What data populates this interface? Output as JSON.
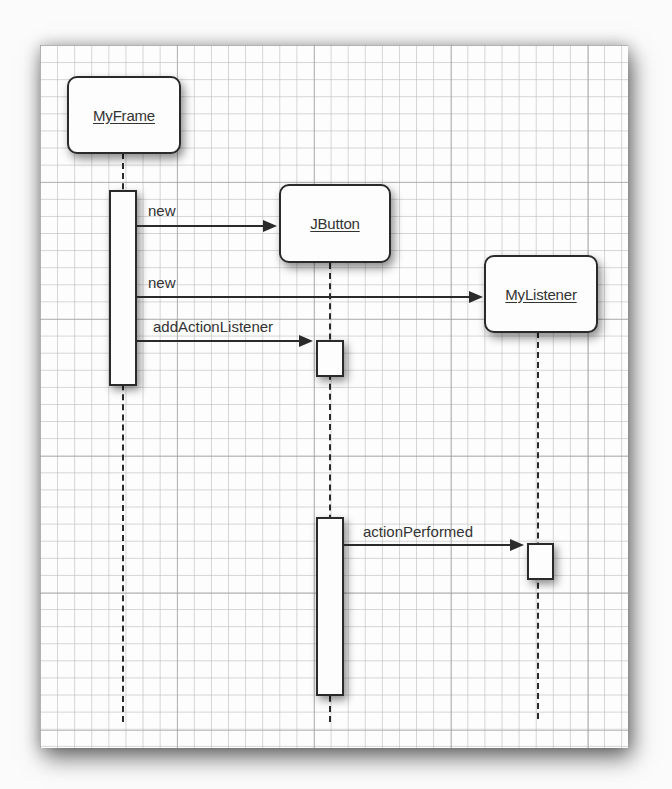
{
  "diagram": {
    "type": "UML sequence diagram",
    "objects": [
      {
        "id": "myframe",
        "label": "MyFrame"
      },
      {
        "id": "jbutton",
        "label": "JButton"
      },
      {
        "id": "mylistener",
        "label": "MyListener"
      }
    ],
    "messages": [
      {
        "from": "MyFrame",
        "to": "JButton",
        "label": "new"
      },
      {
        "from": "MyFrame",
        "to": "MyListener",
        "label": "new"
      },
      {
        "from": "MyFrame",
        "to": "JButton",
        "label": "addActionListener"
      },
      {
        "from": "JButton",
        "to": "MyListener",
        "label": "actionPerformed"
      }
    ],
    "colors": {
      "line": "#2a2a2a",
      "box_fill": "#fdfdfd",
      "grid": "#b9b9b9"
    }
  }
}
